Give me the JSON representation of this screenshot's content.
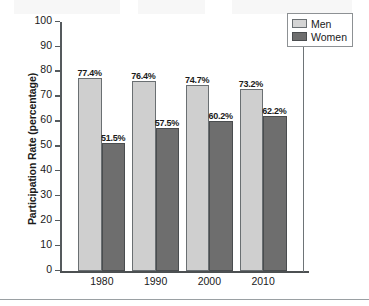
{
  "chart_data": {
    "type": "bar",
    "title": "",
    "xlabel": "",
    "ylabel": "Participation Rate (percentage)",
    "categories": [
      "1980",
      "1990",
      "2000",
      "2010"
    ],
    "ylim": [
      0,
      100
    ],
    "yticks": [
      0,
      10,
      20,
      30,
      40,
      50,
      60,
      70,
      80,
      90,
      100
    ],
    "ytick_labels": [
      "0",
      "10",
      "20",
      "30",
      "40",
      "50",
      "60",
      "70",
      "80",
      "90",
      "100"
    ],
    "grid": false,
    "legend_position": "top-right",
    "series": [
      {
        "name": "Men",
        "color": "#cfcfcf",
        "values": [
          77.4,
          76.4,
          74.7,
          73.2
        ],
        "data_labels": [
          "77.4%",
          "76.4%",
          "74.7%",
          "73.2%"
        ]
      },
      {
        "name": "Women",
        "color": "#6e6e6e",
        "values": [
          51.5,
          57.5,
          60.2,
          62.2
        ],
        "data_labels": [
          "51.5%",
          "57.5%",
          "60.2%",
          "62.2%"
        ]
      }
    ]
  }
}
